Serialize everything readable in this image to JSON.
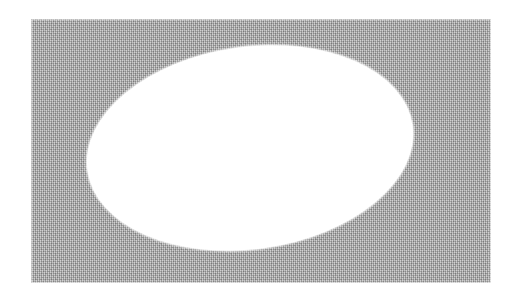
{
  "figure": {
    "kind": "scanned-halftone-figure",
    "caption": "",
    "page_background": "#ffffff",
    "plate": {
      "name": "gray-dithered-rectangle",
      "fill": "#9d9d9d",
      "texture": "dithered-halftone-noise",
      "x": 31,
      "y": 19,
      "width": 460,
      "height": 264
    },
    "shape": {
      "name": "white-ellipse",
      "fill": "#ffffff",
      "center_x": 250,
      "center_y": 148,
      "semi_axis_x": 164,
      "semi_axis_y": 101,
      "rotation_deg": -8
    }
  }
}
